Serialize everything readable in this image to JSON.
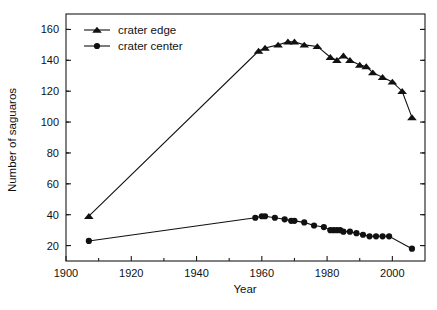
{
  "chart_data": {
    "type": "line",
    "title": "",
    "xlabel": "Year",
    "ylabel": "Number of saguaros",
    "xlim": [
      1900,
      2010
    ],
    "ylim": [
      10,
      170
    ],
    "xticks": [
      1900,
      1920,
      1940,
      1960,
      1980,
      2000
    ],
    "yticks": [
      20,
      40,
      60,
      80,
      100,
      120,
      140,
      160
    ],
    "grid": false,
    "legend_position": "top-left",
    "series": [
      {
        "name": "crater edge",
        "marker": "triangle",
        "color": "#111111",
        "points": [
          [
            1907,
            39
          ],
          [
            1959,
            146
          ],
          [
            1961,
            148
          ],
          [
            1965,
            150
          ],
          [
            1968,
            152
          ],
          [
            1970,
            152
          ],
          [
            1973,
            150
          ],
          [
            1977,
            149
          ],
          [
            1981,
            142
          ],
          [
            1983,
            140
          ],
          [
            1985,
            143
          ],
          [
            1987,
            140
          ],
          [
            1990,
            137
          ],
          [
            1992,
            136
          ],
          [
            1994,
            132
          ],
          [
            1997,
            129
          ],
          [
            2000,
            126
          ],
          [
            2003,
            120
          ],
          [
            2006,
            103
          ]
        ]
      },
      {
        "name": "crater center",
        "marker": "circle",
        "color": "#111111",
        "points": [
          [
            1907,
            23
          ],
          [
            1958,
            38
          ],
          [
            1960,
            39
          ],
          [
            1961,
            39
          ],
          [
            1964,
            38
          ],
          [
            1967,
            37
          ],
          [
            1969,
            36
          ],
          [
            1970,
            36
          ],
          [
            1973,
            35
          ],
          [
            1976,
            33
          ],
          [
            1979,
            32
          ],
          [
            1981,
            30
          ],
          [
            1982,
            30
          ],
          [
            1983,
            30
          ],
          [
            1984,
            30
          ],
          [
            1985,
            29
          ],
          [
            1987,
            29
          ],
          [
            1989,
            28
          ],
          [
            1991,
            27
          ],
          [
            1993,
            26
          ],
          [
            1995,
            26
          ],
          [
            1997,
            26
          ],
          [
            1999,
            26
          ],
          [
            2006,
            18
          ]
        ]
      }
    ]
  },
  "legend": {
    "entries": [
      {
        "label": "crater edge",
        "marker": "triangle"
      },
      {
        "label": "crater center",
        "marker": "circle"
      }
    ]
  },
  "axes": {
    "x_title": "Year",
    "y_title": "Number of saguaros"
  }
}
